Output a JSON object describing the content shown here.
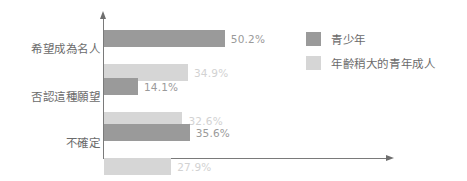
{
  "chart_data": {
    "type": "bar",
    "orientation": "horizontal",
    "title": "",
    "xlabel": "",
    "ylabel": "",
    "grid": false,
    "legend_position": "top-right",
    "xlim": [
      0,
      118
    ],
    "categories": [
      "希望成為名人",
      "否認這種願望",
      "不確定"
    ],
    "series": [
      {
        "name": "青少年",
        "color": "#9a9a9a",
        "label_color": "#9a9a9a",
        "values": [
          50.2,
          14.1,
          35.6
        ],
        "value_labels": [
          "50.2%",
          "14.1%",
          "35.6%"
        ]
      },
      {
        "name": "年齡稍大的青年成人",
        "color": "#d6d6d6",
        "label_color": "#d2d2d2",
        "values": [
          34.9,
          32.6,
          27.9
        ],
        "value_labels": [
          "34.9%",
          "32.6%",
          "27.9%"
        ]
      }
    ]
  },
  "axes": {
    "vertical_axis_color": "#7a7a7a",
    "horizontal_axis_color": "#7a7a7a"
  },
  "legend": {
    "items": [
      {
        "label": "青少年",
        "color": "#9a9a9a"
      },
      {
        "label": "年齡稍大的青年成人",
        "color": "#d6d6d6"
      }
    ]
  }
}
